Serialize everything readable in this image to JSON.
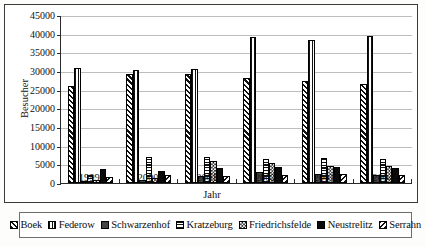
{
  "chart_data": {
    "type": "bar",
    "title": "",
    "xlabel": "Jahr",
    "ylabel": "Besucher",
    "categories": [
      "1999",
      "2000",
      "2001",
      "2002",
      "2003",
      "2004"
    ],
    "ylim": [
      0,
      45000
    ],
    "ytick_values": [
      0,
      5000,
      10000,
      15000,
      20000,
      25000,
      30000,
      35000,
      40000,
      45000
    ],
    "yticks": [
      "0",
      "5000",
      "10000",
      "15000",
      "20000",
      "25000",
      "30000",
      "35000",
      "40000",
      "45000"
    ],
    "grid": true,
    "legend_position": "bottom",
    "series": [
      {
        "name": "Boek",
        "pattern": "diagonal-forward-hatch",
        "values": [
          26100,
          29200,
          29100,
          28200,
          27400,
          26600
        ]
      },
      {
        "name": "Federow",
        "pattern": "vertical-stripes",
        "values": [
          30700,
          30400,
          30600,
          39100,
          38400,
          39300
        ]
      },
      {
        "name": "Schwarzenhof",
        "pattern": "solid-dark-gray",
        "values": [
          600,
          800,
          1800,
          3000,
          2300,
          2200
        ]
      },
      {
        "name": "Kratzeburg",
        "pattern": "horizontal-stripes",
        "values": [
          2200,
          7100,
          7000,
          6400,
          6800,
          6500
        ]
      },
      {
        "name": "Friedrichsfelde",
        "pattern": "checkerboard",
        "values": [
          900,
          1400,
          6000,
          5300,
          4600,
          4500
        ]
      },
      {
        "name": "Neustrelitz",
        "pattern": "solid-black",
        "values": [
          3700,
          3300,
          4100,
          4200,
          4300,
          3900
        ]
      },
      {
        "name": "Serrahn",
        "pattern": "diagonal-back-hatch",
        "values": [
          1700,
          2100,
          2000,
          2200,
          2500,
          2100
        ]
      }
    ]
  },
  "legend": {
    "entries": [
      {
        "label": "Boek"
      },
      {
        "label": "Federow"
      },
      {
        "label": "Schwarzenhof"
      },
      {
        "label": "Kratzeburg"
      },
      {
        "label": "Friedrichsfelde"
      },
      {
        "label": "Neustrelitz"
      },
      {
        "label": "Serrahn"
      }
    ]
  }
}
